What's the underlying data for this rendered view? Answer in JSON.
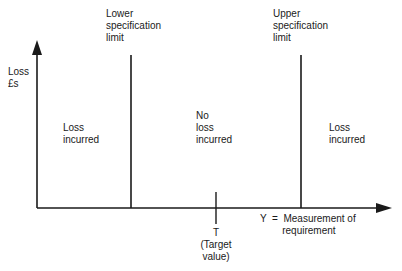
{
  "diagram": {
    "type": "loss-function-step",
    "y_axis": {
      "label": "Loss\n£s"
    },
    "x_axis": {
      "label": "Y  =  Measurement of\n        requirement"
    },
    "lower_limit": {
      "label": "Lower\nspecification\nlimit"
    },
    "upper_limit": {
      "label": "Upper\nspecification\nlimit"
    },
    "target": {
      "label": "T\n(Target\nvalue)"
    },
    "regions": [
      {
        "label": "Loss\nincurred"
      },
      {
        "label": "No\nloss\nincurred"
      },
      {
        "label": "Loss\nincurred"
      }
    ],
    "colors": {
      "line": "#1a1a1a",
      "background": "#ffffff"
    }
  }
}
